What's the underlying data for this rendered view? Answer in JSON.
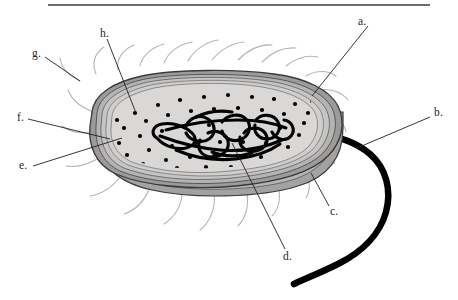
{
  "figure": {
    "kind": "biology-diagram",
    "top_rule": {
      "present": true,
      "color": "#6e6e70"
    },
    "labels": [
      {
        "key": "a",
        "text": "a.",
        "x": 358,
        "y": 17,
        "leader": {
          "x1": 369,
          "y1": 27,
          "x2": 312,
          "y2": 96
        }
      },
      {
        "key": "b",
        "text": "b.",
        "x": 434,
        "y": 108,
        "leader": {
          "x1": 431,
          "y1": 118,
          "x2": 357,
          "y2": 148
        }
      },
      {
        "key": "c",
        "text": "c.",
        "x": 331,
        "y": 207,
        "leader": {
          "x1": 329,
          "y1": 208,
          "x2": 312,
          "y2": 174
        }
      },
      {
        "key": "d",
        "text": "d.",
        "x": 284,
        "y": 253,
        "leader": {
          "x1": 285,
          "y1": 250,
          "x2": 232,
          "y2": 143
        }
      },
      {
        "key": "e",
        "text": "e.",
        "x": 19,
        "y": 164,
        "leader": {
          "x1": 33,
          "y1": 167,
          "x2": 122,
          "y2": 138
        }
      },
      {
        "key": "f",
        "text": "f.",
        "x": 17,
        "y": 115,
        "leader": {
          "x1": 28,
          "y1": 120,
          "x2": 109,
          "y2": 139
        }
      },
      {
        "key": "g",
        "text": "g.",
        "x": 33,
        "y": 50,
        "leader": {
          "x1": 45,
          "y1": 58,
          "x2": 80,
          "y2": 81
        }
      },
      {
        "key": "h",
        "text": "h.",
        "x": 101,
        "y": 29,
        "leader": {
          "x1": 106,
          "y1": 39,
          "x2": 135,
          "y2": 113
        }
      }
    ],
    "colors": {
      "cytoplasm": "#d6d5d3",
      "cell_wall_band": "#b3b2b0",
      "bottom_wall": "#9e9d9c",
      "outline": "#3a3a3a",
      "ribosome": "#000000",
      "dna": "#000000",
      "flagellum": "#000000",
      "pili": "#b5b5b5",
      "label_text": "#231f20"
    },
    "parts": {
      "cell_wall": "cell-wall-layers",
      "flagellum": "flagellum",
      "bottom_membrane": "bottom-cell-envelope",
      "nucleoid": "nucleoid-dna",
      "cytoplasm": "cytoplasm",
      "ribosomes": "ribosome-dots",
      "pili": "pili-fimbriae",
      "plasma_membrane": "plasma-membrane"
    },
    "ribosome_count": 62,
    "pili_count": 22
  }
}
